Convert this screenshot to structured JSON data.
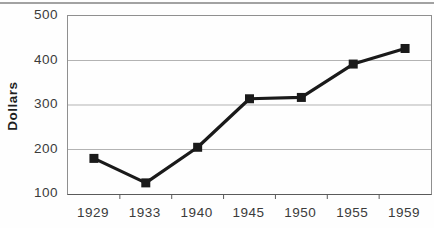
{
  "figure": {
    "kind": "scanned textbook line chart",
    "background": "#fefefe",
    "top_rule_color": "#a2a2a2"
  },
  "chart_data": {
    "type": "line",
    "title": "",
    "xlabel": "",
    "ylabel": "Dollars",
    "categories": [
      "1929",
      "1933",
      "1940",
      "1945",
      "1950",
      "1955",
      "1959"
    ],
    "series": [
      {
        "name": "Dollars",
        "values": [
          180,
          125,
          205,
          314,
          317,
          392,
          427
        ]
      }
    ],
    "ylim": [
      100,
      500
    ],
    "yticks": [
      100,
      200,
      300,
      400,
      500
    ],
    "grid": "horizontal",
    "legend": "none",
    "marker": "filled-square",
    "colors": {
      "line": "#1a1a1a",
      "marker": "#1a1a1a",
      "gridline": "#b3b3b3",
      "plot_border": "#8f8f8f",
      "axis_bottom": "#5a5a5a",
      "tick_mark": "#5a5a5a",
      "tick_text": "#3b3b3b",
      "axis_title_text": "#1f1f1f"
    }
  }
}
